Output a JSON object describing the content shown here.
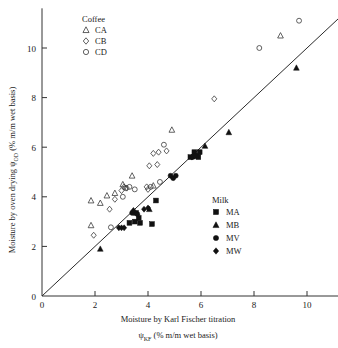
{
  "chart_data": {
    "type": "scatter",
    "title": "",
    "xlabel": "Moisture by Karl Fischer titration",
    "xlabel_line2_pre": "ψ",
    "xlabel_line2_sub": "KF",
    "xlabel_line2_post": " (% m/m wet basis)",
    "ylabel_pre": "Moisture by oven drying ψ",
    "ylabel_sub": "OD",
    "ylabel_post": " (% m/m wet basis)",
    "xlim": [
      0,
      11.3
    ],
    "ylim": [
      0,
      11.6
    ],
    "xticks": [
      0,
      2,
      4,
      6,
      8,
      10
    ],
    "yticks": [
      0,
      2,
      4,
      6,
      8,
      10
    ],
    "xticklabels": [
      "0",
      "2",
      "4",
      "6",
      "8",
      "10"
    ],
    "yticklabels": [
      "0",
      "2",
      "4",
      "6",
      "8",
      "10"
    ],
    "grid": false,
    "reference_line": {
      "type": "identity",
      "from": [
        0,
        0
      ],
      "to": [
        11.2,
        11.2
      ]
    },
    "legends": [
      {
        "name": "coffee-legend",
        "title": "Coffee",
        "position": "top-left",
        "entries": [
          {
            "label": "CA",
            "marker": "triangle-open"
          },
          {
            "label": "CB",
            "marker": "diamond-open"
          },
          {
            "label": "CD",
            "marker": "circle-open"
          }
        ]
      },
      {
        "name": "milk-legend",
        "title": "Milk",
        "position": "lower-right",
        "entries": [
          {
            "label": "MA",
            "marker": "square-filled"
          },
          {
            "label": "MB",
            "marker": "triangle-filled"
          },
          {
            "label": "MV",
            "marker": "circle-filled"
          },
          {
            "label": "MW",
            "marker": "diamond-filled"
          }
        ]
      }
    ],
    "series": [
      {
        "name": "CA",
        "marker": "triangle-open",
        "points": [
          [
            1.85,
            3.85
          ],
          [
            2.2,
            3.75
          ],
          [
            1.85,
            2.85
          ],
          [
            2.45,
            4.05
          ],
          [
            2.75,
            4.15
          ],
          [
            3.05,
            4.5
          ],
          [
            3.4,
            4.85
          ],
          [
            4.2,
            4.45
          ],
          [
            4.9,
            6.7
          ],
          [
            9.0,
            10.5
          ]
        ]
      },
      {
        "name": "CB",
        "marker": "diamond-open",
        "points": [
          [
            1.95,
            2.45
          ],
          [
            2.55,
            3.5
          ],
          [
            2.75,
            3.9
          ],
          [
            3.0,
            4.25
          ],
          [
            3.1,
            4.4
          ],
          [
            3.2,
            4.35
          ],
          [
            3.95,
            4.4
          ],
          [
            4.0,
            4.3
          ],
          [
            4.05,
            5.25
          ],
          [
            4.35,
            5.3
          ],
          [
            4.2,
            5.75
          ],
          [
            4.4,
            5.8
          ],
          [
            4.7,
            5.85
          ],
          [
            6.5,
            7.95
          ]
        ]
      },
      {
        "name": "CD",
        "marker": "circle-open",
        "points": [
          [
            2.6,
            2.77
          ],
          [
            3.05,
            4.0
          ],
          [
            3.15,
            4.35
          ],
          [
            3.3,
            4.4
          ],
          [
            3.5,
            4.3
          ],
          [
            4.1,
            4.4
          ],
          [
            4.45,
            4.6
          ],
          [
            4.6,
            6.1
          ],
          [
            8.2,
            10.0
          ],
          [
            9.7,
            11.1
          ]
        ]
      },
      {
        "name": "MA",
        "marker": "square-filled",
        "points": [
          [
            3.3,
            2.95
          ],
          [
            3.5,
            3.0
          ],
          [
            3.55,
            3.35
          ],
          [
            3.65,
            3.15
          ],
          [
            3.7,
            2.95
          ],
          [
            4.15,
            2.9
          ],
          [
            4.3,
            3.85
          ],
          [
            5.6,
            5.6
          ],
          [
            5.75,
            5.8
          ],
          [
            5.85,
            5.65
          ],
          [
            5.95,
            5.8
          ],
          [
            5.9,
            5.6
          ]
        ]
      },
      {
        "name": "MB",
        "marker": "triangle-filled",
        "points": [
          [
            2.2,
            1.9
          ],
          [
            3.45,
            3.4
          ],
          [
            4.05,
            3.5
          ],
          [
            5.8,
            5.7
          ],
          [
            6.15,
            6.05
          ],
          [
            7.05,
            6.6
          ],
          [
            9.6,
            9.2
          ]
        ]
      },
      {
        "name": "MV",
        "marker": "circle-filled",
        "points": [
          [
            4.85,
            4.85
          ],
          [
            4.95,
            4.75
          ],
          [
            5.05,
            4.85
          ],
          [
            3.4,
            3.35
          ],
          [
            3.6,
            3.3
          ],
          [
            5.7,
            5.6
          ]
        ]
      },
      {
        "name": "MW",
        "marker": "diamond-filled",
        "points": [
          [
            2.9,
            2.75
          ],
          [
            3.0,
            2.75
          ],
          [
            3.1,
            2.75
          ],
          [
            3.45,
            3.45
          ],
          [
            3.85,
            3.5
          ],
          [
            4.0,
            3.55
          ],
          [
            5.65,
            5.6
          ],
          [
            5.75,
            5.65
          ]
        ]
      }
    ]
  }
}
